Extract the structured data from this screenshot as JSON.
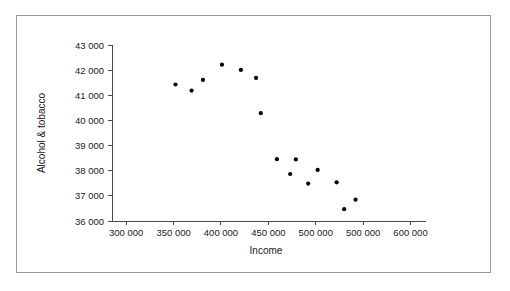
{
  "figure": {
    "background_color": "#ffffff",
    "frame_color": "#9a9a9a",
    "axis_color": "#4a4a4a",
    "marker_color": "#000000"
  },
  "chart_data": {
    "type": "scatter",
    "title": "",
    "xlabel": "Income",
    "ylabel": "Alcohol & tobacco",
    "xlim": [
      285000,
      610000
    ],
    "ylim": [
      36000,
      43200
    ],
    "grid": false,
    "legend": null,
    "xticks": [
      300000,
      350000,
      400000,
      450000,
      500000,
      550000,
      600000
    ],
    "xtick_labels": [
      "300 000",
      "350 000",
      "400 000",
      "450 000",
      "500 000",
      "500 000",
      "600 000"
    ],
    "yticks": [
      36000,
      37000,
      38000,
      39000,
      40000,
      41000,
      42000,
      43000
    ],
    "ytick_labels": [
      "36 000",
      "37 000",
      "38 000",
      "39 000",
      "40 000",
      "41 000",
      "42 000",
      "43 000"
    ],
    "marker": "dot",
    "marker_size": 2.1,
    "x": [
      352000,
      369000,
      381000,
      401000,
      421000,
      437000,
      442000,
      459000,
      479000,
      473000,
      492000,
      502000,
      522000,
      542000,
      530000
    ],
    "y": [
      41430,
      41190,
      41610,
      42220,
      42010,
      41690,
      40290,
      38460,
      38450,
      37870,
      37490,
      38030,
      37540,
      36850,
      36470
    ],
    "points": [
      {
        "x": 352000,
        "y": 41430
      },
      {
        "x": 369000,
        "y": 41190
      },
      {
        "x": 381000,
        "y": 41610
      },
      {
        "x": 401000,
        "y": 42220
      },
      {
        "x": 421000,
        "y": 42010
      },
      {
        "x": 437000,
        "y": 41690
      },
      {
        "x": 442000,
        "y": 40290
      },
      {
        "x": 459000,
        "y": 38460
      },
      {
        "x": 479000,
        "y": 38450
      },
      {
        "x": 473000,
        "y": 37870
      },
      {
        "x": 492000,
        "y": 37490
      },
      {
        "x": 502000,
        "y": 38030
      },
      {
        "x": 522000,
        "y": 37540
      },
      {
        "x": 542000,
        "y": 36850
      },
      {
        "x": 530000,
        "y": 36470
      }
    ]
  }
}
